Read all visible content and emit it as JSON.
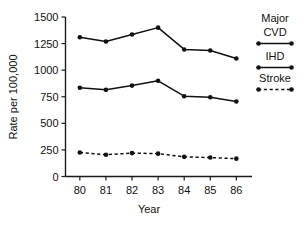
{
  "chart_data": {
    "type": "line",
    "title": "",
    "xlabel": "Year",
    "ylabel": "Rate per 100,000",
    "categories": [
      "80",
      "81",
      "82",
      "83",
      "84",
      "85",
      "86"
    ],
    "x": [
      80,
      81,
      82,
      83,
      84,
      85,
      86
    ],
    "xlim": [
      79.45,
      86.6
    ],
    "ylim": [
      0,
      1500
    ],
    "yticks": [
      0,
      250,
      500,
      750,
      1000,
      1250,
      1500
    ],
    "ytick_labels": [
      "0",
      "250",
      "500",
      "750",
      "1000",
      "1250",
      "1500"
    ],
    "xtick_labels": [
      "80",
      "81",
      "82",
      "83",
      "84",
      "85",
      "86"
    ],
    "grid": false,
    "legend_position": "right",
    "series": [
      {
        "name": "Major CVD",
        "style": "solid",
        "marker": "filled-circle",
        "color": "#111111",
        "values": [
          1310,
          1270,
          1335,
          1400,
          1195,
          1185,
          1110
        ]
      },
      {
        "name": "IHD",
        "style": "solid",
        "marker": "filled-circle",
        "color": "#111111",
        "values": [
          835,
          815,
          855,
          900,
          755,
          745,
          705
        ]
      },
      {
        "name": "Stroke",
        "style": "dashed",
        "marker": "filled-circle",
        "color": "#111111",
        "values": [
          225,
          205,
          220,
          215,
          185,
          178,
          168
        ]
      }
    ]
  },
  "legend": {
    "entries": [
      {
        "label_line1": "Major",
        "label_line2": "CVD",
        "style": "solid"
      },
      {
        "label_line1": "IHD",
        "label_line2": "",
        "style": "solid"
      },
      {
        "label_line1": "Stroke",
        "label_line2": "",
        "style": "dashed"
      }
    ]
  },
  "axes": {
    "y_title": "Rate per 100,000",
    "x_title": "Year",
    "y_labels": [
      "1500",
      "1250",
      "1000",
      "750",
      "500",
      "250",
      "0"
    ],
    "x_labels": [
      "80",
      "81",
      "82",
      "83",
      "84",
      "85",
      "86"
    ]
  },
  "colors": {
    "ink": "#111111",
    "background": "#ffffff"
  }
}
